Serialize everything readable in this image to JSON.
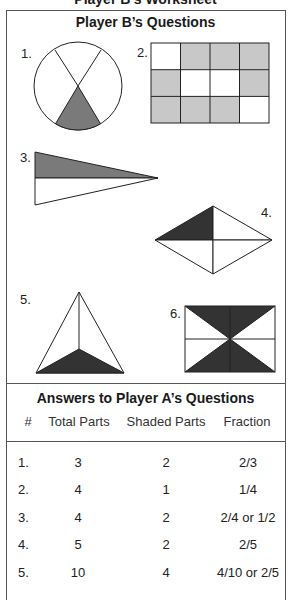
{
  "worksheet": {
    "title": "Player B’s Worksheet"
  },
  "questions_section": {
    "title": "Player B’s Questions",
    "questions": [
      {
        "label": "1.",
        "shape": "circle divided into 3 parts, 1 shaded"
      },
      {
        "label": "2.",
        "shape": "rectangle grid 3x4, 8 shaded"
      },
      {
        "label": "3.",
        "shape": "triangle divided into 2 parts, 1 shaded"
      },
      {
        "label": "4.",
        "shape": "rhombus divided into 4 parts, 1 shaded"
      },
      {
        "label": "5.",
        "shape": "triangle divided into 3 parts, 1 shaded"
      },
      {
        "label": "6.",
        "shape": "rectangle divided into 8 triangles, 4 shaded"
      }
    ],
    "grid_q2": [
      [
        false,
        true,
        true,
        true
      ],
      [
        true,
        false,
        false,
        true
      ],
      [
        true,
        true,
        true,
        false
      ]
    ]
  },
  "answers_section": {
    "title": "Answers to Player A’s Questions",
    "columns": [
      "#",
      "Total Parts",
      "Shaded Parts",
      "Fraction"
    ],
    "rows": [
      {
        "num": "1.",
        "total": "3",
        "shaded": "2",
        "fraction": "2/3"
      },
      {
        "num": "2.",
        "total": "4",
        "shaded": "1",
        "fraction": "1/4"
      },
      {
        "num": "3.",
        "total": "4",
        "shaded": "2",
        "fraction": "2/4 or 1/2"
      },
      {
        "num": "4.",
        "total": "5",
        "shaded": "2",
        "fraction": "2/5"
      },
      {
        "num": "5.",
        "total": "10",
        "shaded": "4",
        "fraction": "4/10 or 2/5"
      }
    ]
  },
  "colors": {
    "light_shade": "#c8c8c8",
    "medium_shade": "#7a7a7a",
    "dark_shade": "#333333",
    "line": "#222222"
  }
}
